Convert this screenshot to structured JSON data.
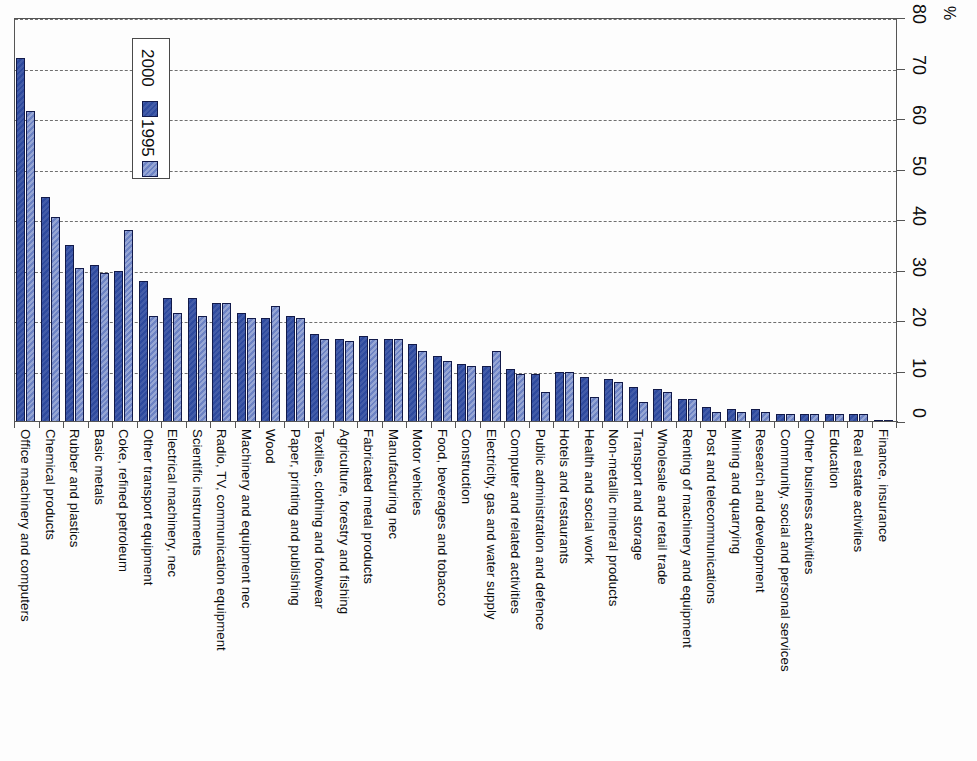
{
  "chart_data": {
    "type": "bar",
    "title": "",
    "subtitle": "",
    "xlabel": "",
    "ylabel": "%",
    "ylim": [
      0,
      80
    ],
    "yticks": [
      0,
      10,
      20,
      30,
      40,
      50,
      60,
      70,
      80
    ],
    "grid": true,
    "orientation": "rotated-vertical-bars",
    "legend_position": "upper-left",
    "legend": [
      "1995",
      "2000"
    ],
    "colors": {
      "1995": "#6d83c4",
      "2000": "#2e4a9e",
      "axis": "#555555",
      "gridline": "#6f6f6f",
      "bar_outline": "#121a4a",
      "background": "#fdfdfd"
    },
    "categories": [
      "Office machinery and computers",
      "Chemical products",
      "Rubber and plastics",
      "Basic metals",
      "Coke, refined petroleum",
      "Other transport equipment",
      "Electrical machinery, nec",
      "Scientific instruments",
      "Radio, TV, communication equipment",
      "Machinery and equipment nec",
      "Wood",
      "Paper, printing and publishing",
      "Textiles, clothing and footwear",
      "Agriculture, forestry and fishing",
      "Fabricated metal products",
      "Manufacturing nec",
      "Motor vehicles",
      "Food, beverages and tobacco",
      "Construction",
      "Electricity, gas and water supply",
      "Computer and related activities",
      "Public administration and defence",
      "Hotels and restaurants",
      "Health and social work",
      "Non-metallic mineral products",
      "Transport and storage",
      "Wholesale and retail trade",
      "Renting of machinery and equipment",
      "Post and telecommunications",
      "Mining and quarrying",
      "Research and development",
      "Community, social and personal services",
      "Other business activities",
      "Education",
      "Real estate activities",
      "Finance, insurance"
    ],
    "series": [
      {
        "name": "2000",
        "values": [
          72.0,
          44.5,
          35.0,
          31.0,
          30.0,
          28.0,
          24.5,
          24.5,
          23.5,
          21.5,
          20.5,
          21.0,
          17.5,
          16.5,
          17.0,
          16.5,
          15.5,
          13.0,
          11.5,
          11.0,
          10.5,
          9.5,
          10.0,
          9.0,
          8.5,
          7.0,
          6.5,
          4.5,
          3.0,
          2.5,
          2.5,
          1.5,
          1.5,
          1.5,
          1.5,
          0.3
        ]
      },
      {
        "name": "1995",
        "values": [
          61.5,
          40.5,
          30.5,
          29.5,
          38.0,
          21.0,
          21.5,
          21.0,
          23.5,
          20.5,
          23.0,
          20.5,
          16.5,
          16.0,
          16.5,
          16.5,
          14.0,
          12.0,
          11.0,
          14.0,
          9.5,
          6.0,
          10.0,
          5.0,
          8.0,
          4.0,
          6.0,
          4.5,
          2.0,
          2.0,
          2.0,
          1.5,
          1.5,
          1.5,
          1.5,
          0.3
        ]
      }
    ]
  },
  "legend": {
    "entries": [
      {
        "label": "2000",
        "swatch": "series-2000-swatch"
      },
      {
        "label": "1995",
        "swatch": "series-1995-swatch"
      }
    ]
  },
  "axis": {
    "unit": "%",
    "tick_labels": [
      "0",
      "10",
      "20",
      "30",
      "40",
      "50",
      "60",
      "70",
      "80"
    ]
  }
}
